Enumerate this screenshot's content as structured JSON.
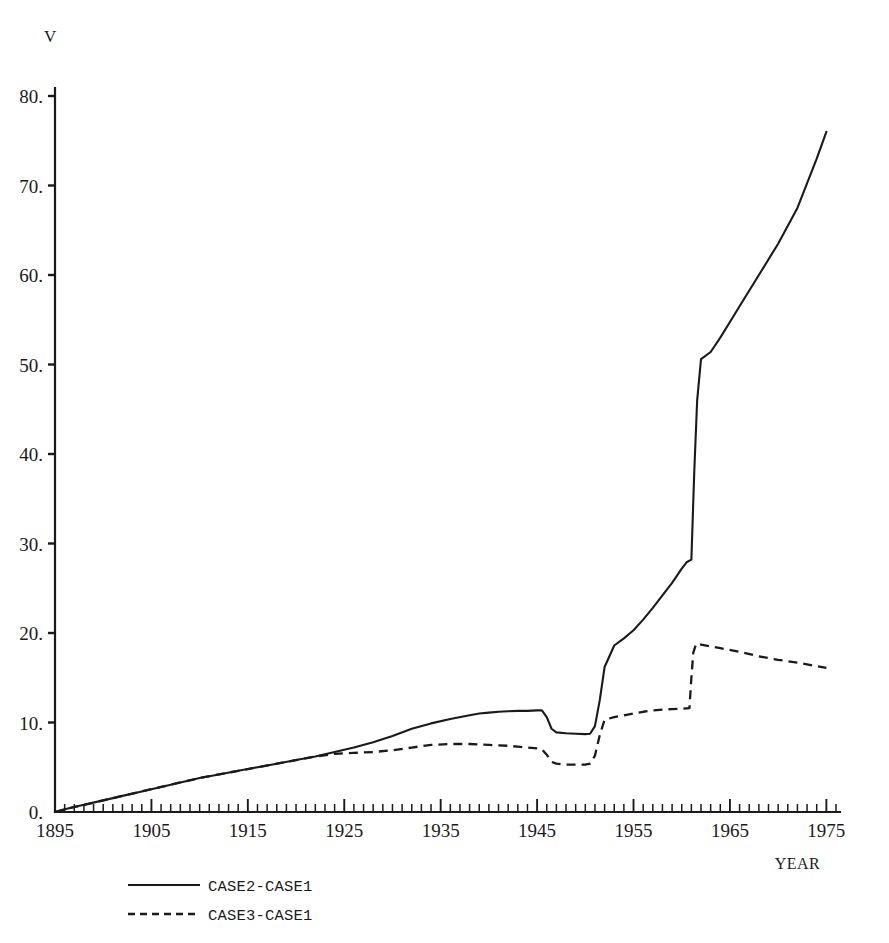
{
  "chart_data": {
    "type": "line",
    "title": "",
    "xlabel": "YEAR",
    "ylabel": "V",
    "xlim": [
      1895,
      1976
    ],
    "ylim": [
      0,
      80
    ],
    "grid": false,
    "legend_position": "bottom-left",
    "y_ticks": [
      "0.",
      "10.",
      "20.",
      "30.",
      "40.",
      "50.",
      "60.",
      "70.",
      "80."
    ],
    "y_tick_values": [
      0,
      10,
      20,
      30,
      40,
      50,
      60,
      70,
      80
    ],
    "x_ticks": [
      "1895",
      "1905",
      "1915",
      "1925",
      "1935",
      "1945",
      "1955",
      "1965",
      "1975"
    ],
    "x_tick_values": [
      1895,
      1905,
      1915,
      1925,
      1935,
      1945,
      1955,
      1965,
      1975
    ],
    "x_minor_tick_interval": 1,
    "series": [
      {
        "name": "CASE2-CASE1",
        "style": "solid",
        "x": [
          1895,
          1896,
          1898,
          1900,
          1902,
          1904,
          1906,
          1908,
          1910,
          1912,
          1914,
          1916,
          1918,
          1920,
          1922,
          1924,
          1926,
          1928,
          1930,
          1932,
          1934,
          1936,
          1938,
          1939,
          1940,
          1941,
          1942,
          1943,
          1944,
          1945,
          1945.5,
          1946,
          1946.5,
          1947,
          1948,
          1949,
          1950,
          1950.5,
          1951,
          1951.5,
          1952,
          1953,
          1954,
          1955,
          1956,
          1957,
          1958,
          1959,
          1960,
          1960.5,
          1961,
          1961.3,
          1961.6,
          1962,
          1963,
          1964,
          1966,
          1968,
          1970,
          1972,
          1974,
          1975
        ],
        "y": [
          0.0,
          0.3,
          0.8,
          1.3,
          1.8,
          2.3,
          2.8,
          3.3,
          3.8,
          4.2,
          4.6,
          5.0,
          5.4,
          5.8,
          6.2,
          6.7,
          7.2,
          7.8,
          8.5,
          9.3,
          9.9,
          10.4,
          10.8,
          11.0,
          11.1,
          11.2,
          11.25,
          11.3,
          11.3,
          11.35,
          11.35,
          10.6,
          9.3,
          8.9,
          8.8,
          8.75,
          8.7,
          8.75,
          9.6,
          12.5,
          16.2,
          18.6,
          19.4,
          20.3,
          21.5,
          22.8,
          24.2,
          25.6,
          27.2,
          27.9,
          28.2,
          38.0,
          46.0,
          50.6,
          51.4,
          53.0,
          56.5,
          60.0,
          63.5,
          67.5,
          73.0,
          76.0
        ]
      },
      {
        "name": "CASE3-CASE1",
        "style": "dashed",
        "x": [
          1895,
          1896,
          1898,
          1900,
          1902,
          1904,
          1906,
          1908,
          1910,
          1912,
          1914,
          1916,
          1918,
          1920,
          1922,
          1924,
          1926,
          1928,
          1930,
          1932,
          1934,
          1936,
          1938,
          1939,
          1940,
          1941,
          1942,
          1943,
          1944,
          1945,
          1945.5,
          1946,
          1946.5,
          1947,
          1948,
          1949,
          1950,
          1950.5,
          1951,
          1951.5,
          1952,
          1953,
          1954,
          1955,
          1956,
          1957,
          1958,
          1959,
          1960,
          1960.8,
          1961,
          1961.2,
          1961.5,
          1962,
          1964,
          1966,
          1968,
          1970,
          1972,
          1974,
          1975
        ],
        "y": [
          0.0,
          0.3,
          0.8,
          1.3,
          1.8,
          2.3,
          2.8,
          3.3,
          3.8,
          4.2,
          4.6,
          5.0,
          5.4,
          5.8,
          6.2,
          6.5,
          6.6,
          6.7,
          6.9,
          7.2,
          7.5,
          7.6,
          7.6,
          7.55,
          7.5,
          7.45,
          7.4,
          7.3,
          7.2,
          7.1,
          7.0,
          6.4,
          5.6,
          5.4,
          5.3,
          5.3,
          5.3,
          5.4,
          6.3,
          8.6,
          10.3,
          10.6,
          10.8,
          11.0,
          11.2,
          11.35,
          11.45,
          11.5,
          11.55,
          11.6,
          15.0,
          17.8,
          18.8,
          18.7,
          18.3,
          17.9,
          17.4,
          17.0,
          16.7,
          16.3,
          16.1
        ]
      }
    ]
  },
  "legend": {
    "entries": [
      {
        "label": "CASE2-CASE1",
        "style": "solid"
      },
      {
        "label": "CASE3-CASE1",
        "style": "dashed"
      }
    ]
  },
  "colors": {
    "ink": "#1a1a1a",
    "background": "#ffffff"
  }
}
